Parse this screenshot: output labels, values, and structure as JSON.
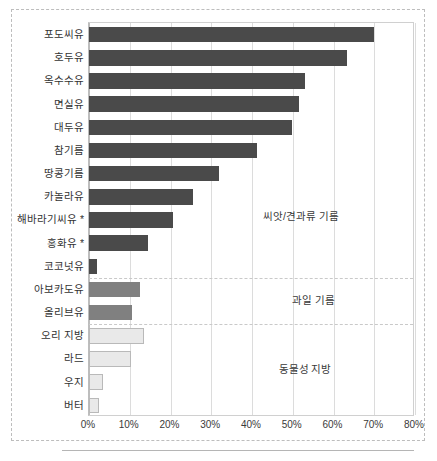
{
  "chart_data": {
    "type": "bar",
    "orientation": "horizontal",
    "title": "",
    "subtitle": "",
    "xlabel": "",
    "ylabel": "",
    "xlim": [
      0,
      80
    ],
    "xtick_labels": [
      "0%",
      "10%",
      "20%",
      "30%",
      "40%",
      "50%",
      "60%",
      "70%",
      "80%"
    ],
    "xtick_values": [
      0,
      10,
      20,
      30,
      40,
      50,
      60,
      70,
      80
    ],
    "grid": true,
    "legend_position": "none",
    "categories": [
      "포도씨유",
      "호두유",
      "옥수수유",
      "면실유",
      "대두유",
      "참기름",
      "땅콩기름",
      "카놀라유",
      "해바라기씨유 *",
      "홍화유 *",
      "코코넛유",
      "아보카도유",
      "올리브유",
      "오리 지방",
      "라드",
      "우지",
      "버터"
    ],
    "values": [
      69.9,
      63.3,
      53.0,
      51.5,
      49.9,
      41.2,
      31.8,
      25.4,
      20.5,
      14.5,
      2.0,
      12.6,
      10.5,
      13.5,
      10.2,
      3.4,
      2.4
    ],
    "groups": [
      {
        "name": "씨앗/견과류 기름",
        "color": "#4a4a4a",
        "categories": [
          "포도씨유",
          "호두유",
          "옥수수유",
          "면실유",
          "대두유",
          "참기름",
          "땅콩기름",
          "카놀라유",
          "해바라기씨유 *",
          "홍화유 *",
          "코코넛유"
        ]
      },
      {
        "name": "과일 기름",
        "color": "#808080",
        "categories": [
          "아보카도유",
          "올리브유"
        ]
      },
      {
        "name": "동물성 지방",
        "color": "#e9e9e9",
        "categories": [
          "오리 지방",
          "라드",
          "우지",
          "버터"
        ]
      }
    ],
    "annotations": [
      {
        "text": "씨앗/견과류 기름",
        "x_pct": 52,
        "row_index": 8
      },
      {
        "text": "과일 기름",
        "x_pct": 55,
        "row_index": 11.6
      },
      {
        "text": "동물성 지방",
        "x_pct": 53,
        "row_index": 14.6
      }
    ]
  },
  "colors": {
    "seed_oil": "#4a4a4a",
    "fruit_oil": "#808080",
    "animal_fat": "#e9e9e9",
    "animal_fat_border": "#b9b9b9",
    "gridline": "#dcdcdc",
    "plot_border": "#d0d0d0",
    "frame_dashed": "#bdbdbd",
    "text": "#333333"
  }
}
